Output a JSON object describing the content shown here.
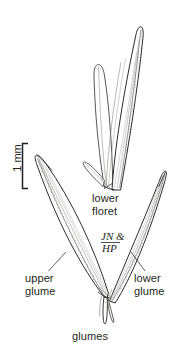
{
  "figure": {
    "kind": "botanical-line-drawing",
    "background_color": "#ffffff",
    "ink_color": "#231f20",
    "stipple_color": "#6e6a68"
  },
  "scale_bar": {
    "label": "1 mm",
    "orientation": "vertical",
    "bracket_top_y": 143,
    "bracket_bottom_y": 189,
    "bracket_x": 22
  },
  "labels": {
    "lower_floret": "lower\nfloret",
    "upper_glume": "upper\nglume",
    "lower_glume": "lower\nglume",
    "glumes": "glumes"
  },
  "signature": {
    "line1": "JN &",
    "line2": "HP"
  },
  "parts": [
    {
      "name": "lower-floret",
      "label": "lower floret",
      "position": "top-center",
      "description": "pair of elongate lanceolate bracts, lemma and palea, tapering to an acute apex"
    },
    {
      "name": "upper-glume",
      "label": "upper glume",
      "position": "left",
      "description": "broad lanceolate glume angled up-left with ciliate stippled lower margin"
    },
    {
      "name": "lower-glume",
      "label": "lower glume",
      "position": "right",
      "description": "narrow elongate glume angled up-right with ciliate stippled outer margin"
    },
    {
      "name": "glumes",
      "label": "glumes",
      "position": "bottom-center",
      "description": "short pedicel where glumes converge"
    }
  ]
}
